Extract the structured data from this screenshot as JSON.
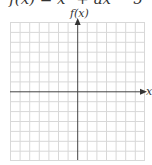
{
  "header": {
    "equation": "f(x) = x³ + ax − 5"
  },
  "axes": {
    "y_label": "f(x)",
    "x_label": "x"
  },
  "grid": {
    "columns": 14,
    "rows": 14,
    "line_color": "#d8d8d8",
    "axis_color": "#444444"
  }
}
